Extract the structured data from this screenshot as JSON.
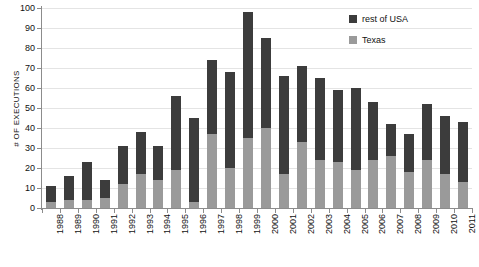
{
  "chart_data": {
    "type": "bar",
    "stacked": true,
    "title": "",
    "xlabel": "",
    "ylabel": "# OF EXECUTIONS",
    "ylim": [
      0,
      100
    ],
    "ytick_step": 10,
    "yticks": [
      0,
      10,
      20,
      30,
      40,
      50,
      60,
      70,
      80,
      90,
      100
    ],
    "grid": true,
    "legend_position": "top-right",
    "categories": [
      "1988",
      "1989",
      "1990",
      "1991",
      "1992",
      "1993",
      "1994",
      "1995",
      "1996",
      "1997",
      "1998",
      "1999",
      "2000",
      "2001",
      "2002",
      "2003",
      "2004",
      "2005",
      "2006",
      "2007",
      "2008",
      "2009",
      "2010",
      "2011"
    ],
    "series": [
      {
        "name": "Texas",
        "color": "#9a9a9a",
        "values": [
          3,
          4,
          4,
          5,
          12,
          17,
          14,
          19,
          3,
          37,
          20,
          35,
          40,
          17,
          33,
          24,
          23,
          19,
          24,
          26,
          18,
          24,
          17,
          13
        ]
      },
      {
        "name": "rest of USA",
        "color": "#3c3c3c",
        "values": [
          8,
          12,
          19,
          9,
          19,
          21,
          17,
          37,
          42,
          37,
          48,
          63,
          45,
          49,
          38,
          41,
          36,
          41,
          29,
          16,
          19,
          28,
          29,
          30
        ]
      }
    ],
    "totals": [
      11,
      16,
      23,
      14,
      31,
      38,
      31,
      56,
      45,
      74,
      68,
      98,
      85,
      66,
      71,
      65,
      59,
      60,
      53,
      42,
      37,
      52,
      46,
      43
    ]
  },
  "legend": {
    "entries": [
      {
        "label": "rest of USA",
        "swatch": "legend-swatch-rest-of-usa"
      },
      {
        "label": "Texas",
        "swatch": "legend-swatch-texas"
      }
    ]
  },
  "colors": {
    "rest_of_usa": "#3c3c3c",
    "texas": "#9a9a9a",
    "axis": "#8c8c8c",
    "grid": "#e4e4e4",
    "text": "#111111",
    "background": "#ffffff"
  }
}
